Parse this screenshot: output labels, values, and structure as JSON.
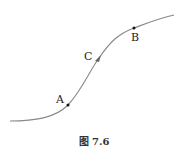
{
  "figure": {
    "caption": "图 7.6",
    "points": {
      "A": {
        "label": "A",
        "x": 68,
        "y": 105
      },
      "B": {
        "label": "B",
        "x": 134,
        "y": 28
      },
      "C": {
        "label": "C",
        "x": 99,
        "y": 58
      }
    },
    "curve_color": "#888888",
    "point_color": "#111111"
  }
}
